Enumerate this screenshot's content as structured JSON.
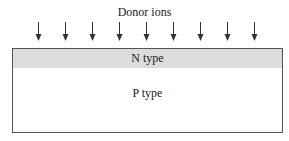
{
  "diagram": {
    "donor_label": "Donor ions",
    "n_layer_label": "N type",
    "p_layer_label": "P type",
    "arrow_count": 9,
    "colors": {
      "n_layer_fill": "#dcdcdc",
      "p_layer_fill": "#ffffff",
      "stroke": "#555555"
    }
  }
}
